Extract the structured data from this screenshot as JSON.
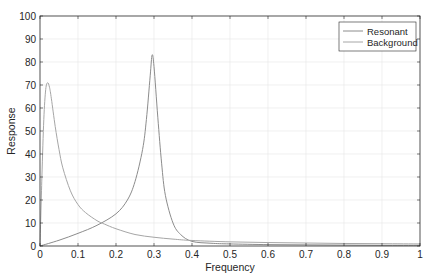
{
  "chart_data": {
    "type": "line",
    "title": "",
    "xlabel": "Frequency",
    "ylabel": "Response",
    "xlim": [
      0,
      1
    ],
    "ylim": [
      0,
      100
    ],
    "xticks": [
      0,
      0.1,
      0.2,
      0.3,
      0.4,
      0.5,
      0.6,
      0.7,
      0.8,
      0.9,
      1
    ],
    "xtick_labels": [
      "0",
      "0.1",
      "0.2",
      "0.3",
      "0.4",
      "0.5",
      "0.6",
      "0.7",
      "0.8",
      "0.9",
      "1"
    ],
    "yticks": [
      0,
      10,
      20,
      30,
      40,
      50,
      60,
      70,
      80,
      90,
      100
    ],
    "ytick_labels": [
      "0",
      "10",
      "20",
      "30",
      "40",
      "50",
      "60",
      "70",
      "80",
      "90",
      "100"
    ],
    "grid": true,
    "legend_position": "upper right",
    "series": [
      {
        "name": "Resonant",
        "color": "#8c8c8c",
        "x": [
          0,
          0.05,
          0.1,
          0.15,
          0.2,
          0.23,
          0.25,
          0.27,
          0.28,
          0.29,
          0.295,
          0.3,
          0.31,
          0.32,
          0.33,
          0.35,
          0.37,
          0.4,
          0.45,
          0.5,
          0.6,
          0.7,
          0.8,
          0.9,
          1
        ],
        "y": [
          0,
          2.5,
          5.5,
          9,
          14,
          20,
          28,
          42,
          55,
          74,
          83,
          78,
          56,
          36,
          22,
          10,
          5,
          2,
          1.2,
          0.9,
          0.6,
          0.5,
          0.4,
          0.3,
          0.3
        ]
      },
      {
        "name": "Background",
        "color": "#a6a6a6",
        "x": [
          0,
          0.005,
          0.01,
          0.015,
          0.02,
          0.025,
          0.03,
          0.04,
          0.05,
          0.06,
          0.08,
          0.1,
          0.12,
          0.15,
          0.17,
          0.2,
          0.25,
          0.3,
          0.35,
          0.4,
          0.5,
          0.6,
          0.7,
          0.8,
          0.9,
          1
        ],
        "y": [
          0,
          30,
          55,
          68,
          71,
          69,
          64,
          52,
          42,
          34,
          24,
          18,
          14.5,
          11,
          9.5,
          7.5,
          5,
          3.8,
          3,
          2.4,
          1.8,
          1.5,
          1.3,
          1.1,
          1,
          0.9
        ]
      }
    ]
  },
  "legend": {
    "items": [
      {
        "label": "Resonant",
        "color": "#8c8c8c"
      },
      {
        "label": "Background",
        "color": "#a6a6a6"
      }
    ]
  }
}
